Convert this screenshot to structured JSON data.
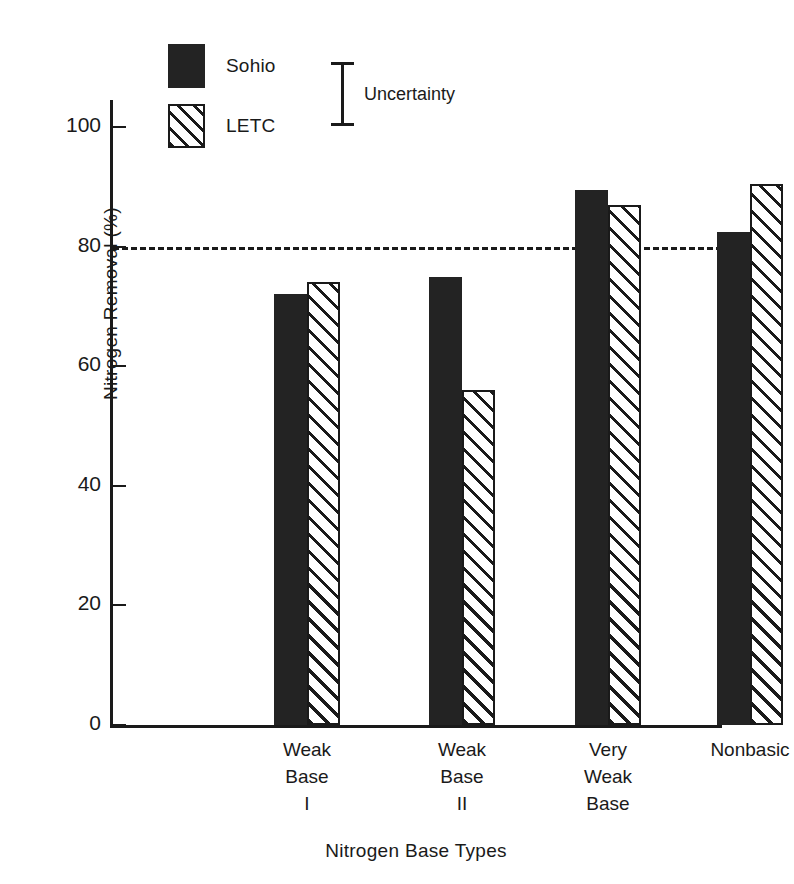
{
  "chart_data": {
    "type": "bar",
    "title": "",
    "xlabel": "Nitrogen Base Types",
    "ylabel": "Nitrogen Removal (%)",
    "categories": [
      "Weak\nBase\nI",
      "Weak\nBase\nII",
      "Very\nWeak\nBase",
      "Nonbasic"
    ],
    "series": [
      {
        "name": "Sohio",
        "values": [
          72,
          75,
          89.5,
          82.5
        ],
        "style": "solid-black"
      },
      {
        "name": "LETC",
        "values": [
          74,
          56,
          87,
          90.5
        ],
        "style": "diagonal-hatch"
      }
    ],
    "ylim": [
      0,
      100
    ],
    "yticks": [
      0,
      20,
      40,
      60,
      80,
      100
    ],
    "ytick_labels": [
      "0",
      "20",
      "40",
      "60",
      "80",
      "100"
    ],
    "grid": false,
    "reference_line": {
      "value": 80,
      "style": "dashed"
    },
    "legend_position": "top-left",
    "annotations": [
      {
        "label": "Uncertainty",
        "type": "error-bar-ibeam"
      }
    ]
  },
  "legend": {
    "items": [
      {
        "label": "Sohio",
        "swatch": "solid-black-swatch"
      },
      {
        "label": "LETC",
        "swatch": "hatched-swatch"
      }
    ]
  },
  "uncertainty": {
    "label": "Uncertainty"
  },
  "axes": {
    "y_title": "Nitrogen Removal (%)",
    "x_title": "Nitrogen Base Types"
  }
}
